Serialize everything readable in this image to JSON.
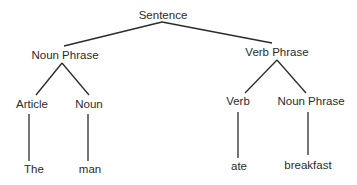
{
  "diagram": {
    "type": "parse-tree",
    "nodes": {
      "sentence": "Sentence",
      "noun_phrase_subject": "Noun Phrase",
      "verb_phrase": "Verb Phrase",
      "article": "Article",
      "noun": "Noun",
      "verb": "Verb",
      "noun_phrase_object": "Noun Phrase",
      "leaf_the": "The",
      "leaf_man": "man",
      "leaf_ate": "ate",
      "leaf_breakfast": "breakfast"
    },
    "edges": [
      [
        "sentence",
        "noun_phrase_subject"
      ],
      [
        "sentence",
        "verb_phrase"
      ],
      [
        "noun_phrase_subject",
        "article"
      ],
      [
        "noun_phrase_subject",
        "noun"
      ],
      [
        "verb_phrase",
        "verb"
      ],
      [
        "verb_phrase",
        "noun_phrase_object"
      ],
      [
        "article",
        "leaf_the"
      ],
      [
        "noun",
        "leaf_man"
      ],
      [
        "verb",
        "leaf_ate"
      ],
      [
        "noun_phrase_object",
        "leaf_breakfast"
      ]
    ]
  }
}
